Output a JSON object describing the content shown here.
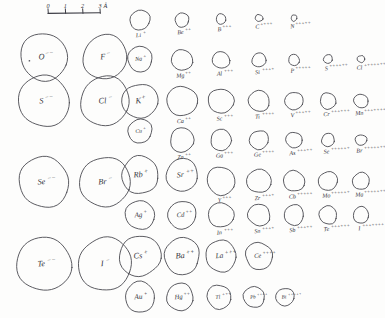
{
  "figure": {
    "units": "angstrom"
  },
  "scale_bar": {
    "name": "angstrom-scale-bar",
    "ticks": [
      "0",
      "1",
      "2",
      "3"
    ],
    "unit_label": "Å",
    "x_start": 48,
    "x_end": 100,
    "y": 13,
    "px_per_unit": 17.3
  },
  "chart_data": {
    "type": "scatter",
    "xlabel": "",
    "ylabel": "",
    "value_unit": "Å",
    "note": "Each circle is an ion drawn with radius proportional to its ionic radius; radius_px values are measured from the figure.",
    "points": [
      {
        "symbol": "O",
        "charge": "2-",
        "label": "O",
        "sup": "−−",
        "cx": 44,
        "cy": 57,
        "radius_px": 23.5,
        "label_inside": true,
        "has_dot": true
      },
      {
        "symbol": "F",
        "charge": "1-",
        "label": "F",
        "sup": "−",
        "cx": 105,
        "cy": 57,
        "radius_px": 22.0,
        "label_inside": true,
        "has_dot": false
      },
      {
        "symbol": "Li",
        "charge": "1+",
        "label": "Li",
        "sup": "+",
        "cx": 140,
        "cy": 20,
        "radius_px": 10.0,
        "label_inside": false,
        "has_dot": false
      },
      {
        "symbol": "Be",
        "charge": "2+",
        "label": "Be",
        "sup": "++",
        "cx": 182,
        "cy": 20,
        "radius_px": 7.0,
        "label_inside": false,
        "has_dot": false
      },
      {
        "symbol": "B",
        "charge": "3+",
        "label": "B",
        "sup": "+++",
        "cx": 221,
        "cy": 19,
        "radius_px": 5.0,
        "label_inside": false,
        "has_dot": false
      },
      {
        "symbol": "C",
        "charge": "4+",
        "label": "C",
        "sup": "++++",
        "cx": 259,
        "cy": 18,
        "radius_px": 3.6,
        "label_inside": false,
        "has_dot": false
      },
      {
        "symbol": "N",
        "charge": "5+",
        "label": "N",
        "sup": "+++++",
        "cx": 294,
        "cy": 18,
        "radius_px": 3.0,
        "label_inside": false,
        "has_dot": false
      },
      {
        "symbol": "S",
        "charge": "2-",
        "label": "S",
        "sup": "−−",
        "cx": 44,
        "cy": 101,
        "radius_px": 25.5,
        "label_inside": true,
        "has_dot": false
      },
      {
        "symbol": "Cl",
        "charge": "1-",
        "label": "Cl",
        "sup": "−",
        "cx": 105,
        "cy": 101,
        "radius_px": 24.5,
        "label_inside": true,
        "has_dot": false
      },
      {
        "symbol": "Na",
        "charge": "1+",
        "label": "Na",
        "sup": "+",
        "cx": 140,
        "cy": 59,
        "radius_px": 12.5,
        "label_inside": true,
        "has_dot": false
      },
      {
        "symbol": "Mg",
        "charge": "2+",
        "label": "Mg",
        "sup": "++",
        "cx": 182,
        "cy": 60,
        "radius_px": 10.5,
        "label_inside": false,
        "has_dot": false
      },
      {
        "symbol": "Al",
        "charge": "3+",
        "label": "Al",
        "sup": "+++",
        "cx": 221,
        "cy": 60,
        "radius_px": 8.5,
        "label_inside": false,
        "has_dot": false
      },
      {
        "symbol": "Si",
        "charge": "4+",
        "label": "Si",
        "sup": "++++",
        "cx": 259,
        "cy": 60,
        "radius_px": 7.0,
        "label_inside": false,
        "has_dot": false
      },
      {
        "symbol": "P",
        "charge": "5+",
        "label": "P",
        "sup": "+++++",
        "cx": 294,
        "cy": 60,
        "radius_px": 5.5,
        "label_inside": false,
        "has_dot": false
      },
      {
        "symbol": "S",
        "charge": "6+",
        "label": "S",
        "sup": "++++++",
        "cx": 328,
        "cy": 59,
        "radius_px": 4.4,
        "label_inside": false,
        "has_dot": false
      },
      {
        "symbol": "Cl",
        "charge": "7+",
        "label": "Cl",
        "sup": "+++++++",
        "cx": 361,
        "cy": 59,
        "radius_px": 3.6,
        "label_inside": false,
        "has_dot": false
      },
      {
        "symbol": "K",
        "charge": "1+",
        "label": "K",
        "sup": "+",
        "cx": 140,
        "cy": 101,
        "radius_px": 17.5,
        "label_inside": true,
        "has_dot": false
      },
      {
        "symbol": "Ca",
        "charge": "2+",
        "label": "Ca",
        "sup": "++",
        "cx": 182,
        "cy": 101,
        "radius_px": 15.0,
        "label_inside": false,
        "has_dot": false
      },
      {
        "symbol": "Sc",
        "charge": "3+",
        "label": "Sc",
        "sup": "+++",
        "cx": 221,
        "cy": 101,
        "radius_px": 12.5,
        "label_inside": false,
        "has_dot": false
      },
      {
        "symbol": "Ti",
        "charge": "4+",
        "label": "Ti",
        "sup": "++++",
        "cx": 259,
        "cy": 101,
        "radius_px": 10.5,
        "label_inside": false,
        "has_dot": false
      },
      {
        "symbol": "V",
        "charge": "5+",
        "label": "V",
        "sup": "+++++",
        "cx": 294,
        "cy": 101,
        "radius_px": 9.0,
        "label_inside": false,
        "has_dot": false
      },
      {
        "symbol": "Cr",
        "charge": "6+",
        "label": "Cr",
        "sup": "++++++",
        "cx": 328,
        "cy": 101,
        "radius_px": 8.0,
        "label_inside": false,
        "has_dot": false
      },
      {
        "symbol": "Mn",
        "charge": "7+",
        "label": "Mn",
        "sup": "+++++++",
        "cx": 361,
        "cy": 101,
        "radius_px": 7.0,
        "label_inside": false,
        "has_dot": false
      },
      {
        "symbol": "Cu",
        "charge": "1+",
        "label": "Cu",
        "sup": "+",
        "cx": 140,
        "cy": 131,
        "radius_px": 12.0,
        "label_inside": true,
        "has_dot": false
      },
      {
        "symbol": "Zn",
        "charge": "2+",
        "label": "Zn",
        "sup": "++",
        "cx": 182,
        "cy": 140,
        "radius_px": 12.0,
        "label_inside": false,
        "has_dot": false
      },
      {
        "symbol": "Ga",
        "charge": "3+",
        "label": "Ga",
        "sup": "+++",
        "cx": 221,
        "cy": 140,
        "radius_px": 10.5,
        "label_inside": false,
        "has_dot": false
      },
      {
        "symbol": "Ge",
        "charge": "4+",
        "label": "Ge",
        "sup": "++++",
        "cx": 259,
        "cy": 140,
        "radius_px": 9.5,
        "label_inside": false,
        "has_dot": false
      },
      {
        "symbol": "As",
        "charge": "5+",
        "label": "As",
        "sup": "+++++",
        "cx": 294,
        "cy": 140,
        "radius_px": 8.0,
        "label_inside": false,
        "has_dot": false
      },
      {
        "symbol": "Se",
        "charge": "6+",
        "label": "Se",
        "sup": "++++++",
        "cx": 328,
        "cy": 140,
        "radius_px": 6.5,
        "label_inside": false,
        "has_dot": false
      },
      {
        "symbol": "Br",
        "charge": "7+",
        "label": "Br",
        "sup": "+++++++",
        "cx": 361,
        "cy": 140,
        "radius_px": 5.5,
        "label_inside": false,
        "has_dot": false
      },
      {
        "symbol": "Se",
        "charge": "2-",
        "label": "Se",
        "sup": "−−",
        "cx": 44,
        "cy": 182,
        "radius_px": 25.0,
        "label_inside": true,
        "has_dot": false
      },
      {
        "symbol": "Br",
        "charge": "1-",
        "label": "Br",
        "sup": "−",
        "cx": 105,
        "cy": 182,
        "radius_px": 25.0,
        "label_inside": true,
        "has_dot": false
      },
      {
        "symbol": "Rb",
        "charge": "1+",
        "label": "Rb",
        "sup": "+",
        "cx": 140,
        "cy": 175,
        "radius_px": 18.5,
        "label_inside": true,
        "has_dot": false
      },
      {
        "symbol": "Sr",
        "charge": "2+",
        "label": "Sr",
        "sup": "++",
        "cx": 182,
        "cy": 175,
        "radius_px": 16.0,
        "label_inside": true,
        "has_dot": false
      },
      {
        "symbol": "Y",
        "charge": "3+",
        "label": "Y",
        "sup": "+++",
        "cx": 221,
        "cy": 181,
        "radius_px": 14.0,
        "label_inside": false,
        "has_dot": false
      },
      {
        "symbol": "Zr",
        "charge": "4+",
        "label": "Zr",
        "sup": "++++",
        "cx": 259,
        "cy": 181,
        "radius_px": 12.0,
        "label_inside": false,
        "has_dot": false
      },
      {
        "symbol": "Cb",
        "charge": "5+",
        "label": "Cb",
        "sup": "+++++",
        "cx": 294,
        "cy": 181,
        "radius_px": 10.5,
        "label_inside": false,
        "has_dot": false
      },
      {
        "symbol": "Mo",
        "charge": "6+",
        "label": "Mo",
        "sup": "++++++",
        "cx": 328,
        "cy": 181,
        "radius_px": 9.5,
        "label_inside": false,
        "has_dot": false
      },
      {
        "symbol": "Ma",
        "charge": "7+",
        "label": "Ma",
        "sup": "+++++++",
        "cx": 361,
        "cy": 181,
        "radius_px": 8.5,
        "label_inside": false,
        "has_dot": false
      },
      {
        "symbol": "Ag",
        "charge": "1+",
        "label": "Ag",
        "sup": "+",
        "cx": 140,
        "cy": 215,
        "radius_px": 14.5,
        "label_inside": true,
        "has_dot": false
      },
      {
        "symbol": "Cd",
        "charge": "2+",
        "label": "Cd",
        "sup": "++",
        "cx": 182,
        "cy": 215,
        "radius_px": 14.0,
        "label_inside": true,
        "has_dot": false
      },
      {
        "symbol": "In",
        "charge": "3+",
        "label": "In",
        "sup": "+++",
        "cx": 221,
        "cy": 215,
        "radius_px": 12.5,
        "label_inside": false,
        "has_dot": false
      },
      {
        "symbol": "Sn",
        "charge": "4+",
        "label": "Sn",
        "sup": "++++",
        "cx": 259,
        "cy": 215,
        "radius_px": 11.0,
        "label_inside": false,
        "has_dot": false
      },
      {
        "symbol": "Sb",
        "charge": "5+",
        "label": "Sb",
        "sup": "+++++",
        "cx": 294,
        "cy": 215,
        "radius_px": 10.0,
        "label_inside": false,
        "has_dot": false
      },
      {
        "symbol": "Te",
        "charge": "6+",
        "label": "Te",
        "sup": "++++++",
        "cx": 328,
        "cy": 215,
        "radius_px": 9.0,
        "label_inside": false,
        "has_dot": false
      },
      {
        "symbol": "I",
        "charge": "7+",
        "label": "I",
        "sup": "+++++++",
        "cx": 361,
        "cy": 215,
        "radius_px": 8.0,
        "label_inside": false,
        "has_dot": false
      },
      {
        "symbol": "Te",
        "charge": "2-",
        "label": "Te",
        "sup": "−−",
        "cx": 44,
        "cy": 264,
        "radius_px": 27.0,
        "label_inside": true,
        "has_dot": false
      },
      {
        "symbol": "I",
        "charge": "1-",
        "label": "I",
        "sup": "−",
        "cx": 105,
        "cy": 264,
        "radius_px": 26.5,
        "label_inside": true,
        "has_dot": false
      },
      {
        "symbol": "Cs",
        "charge": "1+",
        "label": "Cs",
        "sup": "+",
        "cx": 140,
        "cy": 256,
        "radius_px": 20.5,
        "label_inside": true,
        "has_dot": false
      },
      {
        "symbol": "Ba",
        "charge": "2+",
        "label": "Ba",
        "sup": "++",
        "cx": 182,
        "cy": 256,
        "radius_px": 18.0,
        "label_inside": true,
        "has_dot": false
      },
      {
        "symbol": "La",
        "charge": "3+",
        "label": "La",
        "sup": "+++",
        "cx": 221,
        "cy": 256,
        "radius_px": 15.5,
        "label_inside": true,
        "has_dot": false
      },
      {
        "symbol": "Ce",
        "charge": "4+",
        "label": "Ce",
        "sup": "++++",
        "cx": 259,
        "cy": 256,
        "radius_px": 13.5,
        "label_inside": true,
        "has_dot": false
      },
      {
        "symbol": "Au",
        "charge": "1+",
        "label": "Au",
        "sup": "+",
        "cx": 140,
        "cy": 297,
        "radius_px": 15.0,
        "label_inside": true,
        "has_dot": false
      },
      {
        "symbol": "Hg",
        "charge": "2+",
        "label": "Hg",
        "sup": "++",
        "cx": 180,
        "cy": 297,
        "radius_px": 13.5,
        "label_inside": true,
        "has_dot": false
      },
      {
        "symbol": "Tl",
        "charge": "3+",
        "label": "Tl",
        "sup": "+++",
        "cx": 219,
        "cy": 297,
        "radius_px": 12.0,
        "label_inside": true,
        "has_dot": false
      },
      {
        "symbol": "Pb",
        "charge": "4+",
        "label": "Pb",
        "sup": "++++",
        "cx": 254,
        "cy": 297,
        "radius_px": 10.5,
        "label_inside": true,
        "has_dot": false
      },
      {
        "symbol": "Bi",
        "charge": "5+",
        "label": "Bi",
        "sup": "+++++",
        "cx": 285,
        "cy": 297,
        "radius_px": 9.0,
        "label_inside": true,
        "has_dot": false
      }
    ]
  }
}
